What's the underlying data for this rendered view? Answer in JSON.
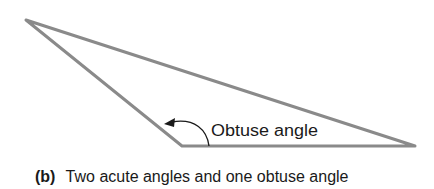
{
  "figure": {
    "angle_label": "Obtuse angle",
    "caption": {
      "tag": "(b)",
      "text": "Two acute angles and one obtuse angle"
    },
    "triangle": {
      "vertices": [
        [
          26,
          20
        ],
        [
          182,
          146
        ],
        [
          415,
          146
        ]
      ],
      "stroke_color": "#8a8a8a"
    },
    "arrow_color": "#1a1a1a"
  }
}
